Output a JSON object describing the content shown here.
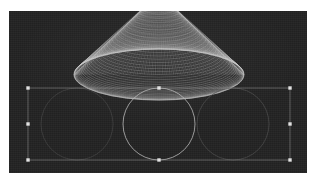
{
  "canvas": {
    "background_color": "#232323",
    "page_background_color": "#ffffff",
    "left": 9,
    "top": 11,
    "width": 298,
    "height": 162
  },
  "artwork": {
    "title": "moire-sphere-composition",
    "stroke_color": "#d8d8d8",
    "faint_stroke_color": "#4a4a4a",
    "dome": {
      "shape": "sphere-moire-mesh",
      "center_x": 150,
      "center_y": -18,
      "radius": 85,
      "meridian_count": 72,
      "parallel_count": 40,
      "stroke_color": "#cfcfcf",
      "stroke_width": 0.35
    },
    "circles": [
      {
        "name": "left-circle",
        "cx": 68,
        "cy": 113,
        "r": 36,
        "stroke_color": "#444444",
        "stroke_width": 0.7
      },
      {
        "name": "center-circle",
        "cx": 150,
        "cy": 113,
        "r": 36,
        "stroke_color": "#b9b9b9",
        "stroke_width": 0.8
      },
      {
        "name": "right-circle",
        "cx": 224,
        "cy": 113,
        "r": 36,
        "stroke_color": "#4d4d4d",
        "stroke_width": 0.7
      }
    ]
  },
  "selection": {
    "name": "bounding-box",
    "x": 19,
    "y": 77,
    "width": 262,
    "height": 72,
    "stroke_color": "#9a9a9a",
    "handle_fill": "#e6e6e6",
    "handle_size": 3,
    "handles": [
      {
        "name": "handle-top-left",
        "cx": 19,
        "cy": 77
      },
      {
        "name": "handle-top-center",
        "cx": 150,
        "cy": 77
      },
      {
        "name": "handle-top-right",
        "cx": 281,
        "cy": 77
      },
      {
        "name": "handle-middle-left",
        "cx": 19,
        "cy": 113
      },
      {
        "name": "handle-middle-right",
        "cx": 281,
        "cy": 113
      },
      {
        "name": "handle-bottom-left",
        "cx": 19,
        "cy": 149
      },
      {
        "name": "handle-bottom-center",
        "cx": 150,
        "cy": 149
      },
      {
        "name": "handle-bottom-right",
        "cx": 281,
        "cy": 149
      }
    ]
  }
}
